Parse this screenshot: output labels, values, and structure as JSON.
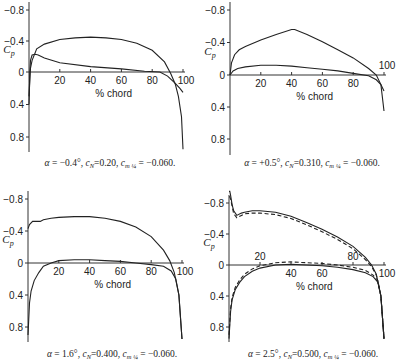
{
  "figure": {
    "panel_count": 4
  },
  "chart_data": [
    {
      "type": "line",
      "title": "",
      "xlabel": "% chord",
      "ylabel": "Cp",
      "xlim": [
        0,
        100
      ],
      "ylim": [
        -0.8,
        0.8
      ],
      "y_inverted": true,
      "x_ticks": [
        20,
        40,
        60,
        80,
        100
      ],
      "y_ticks": [
        -0.8,
        -0.4,
        0,
        0.4,
        0.8
      ],
      "y_tick_labels": [
        "-0.8",
        "-0.4",
        "0",
        "0.4",
        "0.8"
      ],
      "caption": "α = −0.4°, cN=0.20, cm¼ = −0.060.",
      "caption_parts": {
        "alpha": "−0.4°",
        "cN": "0.20",
        "cm_quarter": "−0.060"
      },
      "frame": {
        "x0": 29,
        "x100": 183,
        "y_m08": 10,
        "y_0": 72,
        "y_p08": 137,
        "axis_bottom": 152,
        "caption_y": 166,
        "caption_x": 110
      },
      "series": [
        {
          "name": "upper surface",
          "style": "solid",
          "x": [
            0,
            1,
            2,
            5,
            10,
            20,
            30,
            40,
            50,
            60,
            70,
            80,
            88,
            92,
            95,
            97,
            99,
            100
          ],
          "y": [
            0.3,
            -0.05,
            -0.15,
            -0.3,
            -0.36,
            -0.42,
            -0.44,
            -0.45,
            -0.44,
            -0.42,
            -0.37,
            -0.28,
            -0.13,
            0.02,
            0.15,
            0.3,
            0.55,
            0.95
          ]
        },
        {
          "name": "lower surface",
          "style": "solid",
          "x": [
            0,
            0.5,
            1,
            2,
            4,
            6,
            10,
            20,
            40,
            60,
            75,
            85,
            90,
            95,
            98,
            100
          ],
          "y": [
            0.4,
            0.0,
            -0.15,
            -0.22,
            -0.23,
            -0.22,
            -0.18,
            -0.12,
            -0.07,
            -0.04,
            -0.01,
            0.0,
            0.05,
            0.14,
            0.2,
            0.25
          ]
        }
      ]
    },
    {
      "type": "line",
      "title": "",
      "xlabel": "% chord",
      "ylabel": "Cp",
      "xlim": [
        0,
        100
      ],
      "ylim": [
        -0.8,
        0.8
      ],
      "y_inverted": true,
      "x_ticks": [
        20,
        40,
        60,
        80,
        100
      ],
      "y_ticks": [
        -0.8,
        -0.4,
        0,
        0.4,
        0.8
      ],
      "y_tick_labels": [
        "-0.8",
        "-0.4",
        "0",
        "0.4",
        "0.8"
      ],
      "caption": "α = +0.5°, cN = 0.310, cm¼ = −0.060.",
      "caption_parts": {
        "alpha": "+0.5°",
        "cN": "0.310",
        "cm_quarter": "−0.060"
      },
      "frame": {
        "x0": 230,
        "x100": 384,
        "y_m08": 10,
        "y_0": 75,
        "y_p08": 139,
        "axis_bottom": 155,
        "caption_y": 166,
        "caption_x": 312
      },
      "series": [
        {
          "name": "upper surface",
          "style": "solid",
          "x": [
            0,
            1,
            3,
            6,
            10,
            20,
            30,
            40,
            42,
            50,
            60,
            70,
            80,
            90,
            95,
            98,
            100
          ],
          "y": [
            0.0,
            -0.15,
            -0.25,
            -0.31,
            -0.35,
            -0.43,
            -0.5,
            -0.56,
            -0.56,
            -0.5,
            -0.41,
            -0.31,
            -0.21,
            -0.08,
            0.0,
            0.12,
            0.45
          ]
        },
        {
          "name": "lower surface",
          "style": "solid",
          "x": [
            0,
            2,
            5,
            10,
            20,
            30,
            40,
            50,
            60,
            70,
            80,
            90,
            95,
            98,
            100
          ],
          "y": [
            0.0,
            -0.05,
            -0.08,
            -0.1,
            -0.12,
            -0.12,
            -0.11,
            -0.09,
            -0.07,
            -0.05,
            -0.02,
            0.01,
            0.06,
            0.12,
            0.2
          ]
        }
      ]
    },
    {
      "type": "line",
      "title": "",
      "xlabel": "% chord",
      "ylabel": "Cp",
      "xlim": [
        0,
        100
      ],
      "ylim": [
        -0.8,
        0.8
      ],
      "y_inverted": true,
      "x_ticks": [
        20,
        40,
        60,
        80,
        100
      ],
      "y_ticks": [
        -0.8,
        -0.4,
        0,
        0.4,
        0.8
      ],
      "y_tick_labels": [
        "-0.8",
        "-0.4",
        "0",
        "0.4",
        "0.8"
      ],
      "caption": "α = 1.6°, cN = 0.400, cm¼ = −0.060.",
      "caption_parts": {
        "alpha": "1.6°",
        "cN": "0.400",
        "cm_quarter": "−0.060"
      },
      "frame": {
        "x0": 28,
        "x100": 182,
        "y_m08": 199,
        "y_0": 263,
        "y_p08": 327,
        "axis_bottom": 342,
        "caption_y": 357,
        "caption_x": 112
      },
      "series": [
        {
          "name": "upper surface",
          "style": "solid",
          "x": [
            0,
            1,
            3,
            5,
            8,
            10,
            15,
            20,
            30,
            40,
            50,
            60,
            70,
            80,
            88,
            92,
            95,
            98,
            100
          ],
          "y": [
            -0.43,
            -0.48,
            -0.52,
            -0.52,
            -0.52,
            -0.54,
            -0.56,
            -0.57,
            -0.58,
            -0.58,
            -0.56,
            -0.52,
            -0.45,
            -0.33,
            -0.16,
            -0.03,
            0.12,
            0.4,
            0.95
          ]
        },
        {
          "name": "lower surface",
          "style": "solid",
          "x": [
            0,
            1,
            2,
            4,
            7,
            10,
            15,
            20,
            30,
            40,
            50,
            60,
            70,
            80,
            88,
            93,
            96,
            98,
            100
          ],
          "y": [
            0.9,
            0.5,
            0.35,
            0.22,
            0.12,
            0.04,
            0.0,
            -0.03,
            -0.04,
            -0.04,
            -0.03,
            -0.02,
            0.0,
            0.02,
            0.04,
            0.1,
            0.2,
            0.4,
            0.95
          ]
        }
      ]
    },
    {
      "type": "line",
      "title": "",
      "xlabel": "% chord",
      "ylabel": "Cp",
      "xlim": [
        0,
        100
      ],
      "ylim": [
        -0.8,
        0.8
      ],
      "y_inverted": true,
      "x_ticks": [
        20,
        40,
        60,
        80,
        100
      ],
      "x_tick_positions_note": "20 and 80 labels drawn above the axis",
      "y_ticks": [
        -0.8,
        -0.4,
        0,
        0.4,
        0.8
      ],
      "y_tick_labels": [
        "-0.8",
        "-0.4",
        "0",
        "0.4",
        "0.8"
      ],
      "caption": "α = 2.5°, cN = 0.500, cm¼ = −0.060.",
      "caption_parts": {
        "alpha": "2.5°",
        "cN": "0.500",
        "cm_quarter": "−0.060"
      },
      "frame": {
        "x0": 229,
        "x100": 384,
        "y_m08": 203,
        "y_0": 265,
        "y_p08": 327,
        "axis_bottom": 342,
        "caption_y": 357,
        "caption_x": 313
      },
      "series": [
        {
          "name": "upper surface (solid)",
          "style": "solid",
          "x": [
            0,
            0.5,
            1,
            2,
            3,
            5,
            8,
            10,
            15,
            20,
            30,
            40,
            50,
            60,
            70,
            80,
            88,
            92,
            95,
            98,
            100
          ],
          "y": [
            -0.95,
            -0.95,
            -0.9,
            -0.78,
            -0.7,
            -0.64,
            -0.67,
            -0.68,
            -0.7,
            -0.7,
            -0.68,
            -0.63,
            -0.55,
            -0.46,
            -0.36,
            -0.24,
            -0.1,
            0.0,
            0.12,
            0.4,
            0.95
          ]
        },
        {
          "name": "upper surface (dashed)",
          "style": "dashed",
          "x": [
            0,
            0.5,
            1,
            2,
            3,
            5,
            8,
            10,
            15,
            20,
            30,
            40,
            50,
            60,
            70,
            80,
            88,
            92,
            95,
            98,
            100
          ],
          "y": [
            -0.88,
            -0.88,
            -0.85,
            -0.76,
            -0.66,
            -0.61,
            -0.64,
            -0.66,
            -0.67,
            -0.67,
            -0.65,
            -0.6,
            -0.52,
            -0.43,
            -0.33,
            -0.21,
            -0.07,
            0.02,
            0.13,
            0.4,
            0.95
          ]
        },
        {
          "name": "lower surface (solid)",
          "style": "solid",
          "x": [
            0,
            1,
            2,
            4,
            7,
            10,
            15,
            20,
            30,
            40,
            50,
            60,
            70,
            80,
            88,
            93,
            96,
            98,
            100
          ],
          "y": [
            0.95,
            0.6,
            0.45,
            0.32,
            0.22,
            0.15,
            0.08,
            0.04,
            0.0,
            -0.01,
            0.0,
            0.01,
            0.03,
            0.06,
            0.1,
            0.15,
            0.22,
            0.4,
            0.95
          ]
        },
        {
          "name": "lower surface (dashed)",
          "style": "dashed",
          "x": [
            0,
            1,
            2,
            4,
            7,
            10,
            15,
            20,
            30,
            40,
            50,
            60,
            70,
            80,
            88,
            93,
            96,
            98,
            100
          ],
          "y": [
            0.9,
            0.56,
            0.42,
            0.29,
            0.19,
            0.12,
            0.05,
            0.01,
            -0.03,
            -0.04,
            -0.03,
            -0.02,
            0.0,
            0.03,
            0.07,
            0.13,
            0.2,
            0.4,
            0.95
          ]
        }
      ]
    }
  ]
}
